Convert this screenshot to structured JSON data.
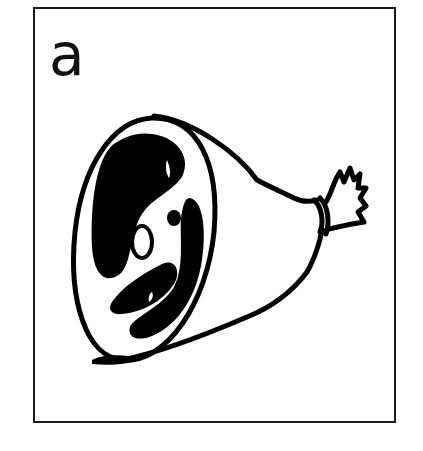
{
  "card": {
    "letter": "a",
    "illustration": "ham-icon",
    "border_color": "#1a1a1a",
    "background": "#ffffff"
  }
}
